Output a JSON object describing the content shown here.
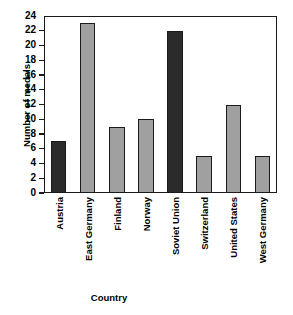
{
  "chart_data": {
    "type": "bar",
    "title": "",
    "xlabel": "Country",
    "ylabel": "Number of medals",
    "categories": [
      "Austria",
      "East Germany",
      "Finland",
      "Norway",
      "Soviet Union",
      "Switzerland",
      "United States",
      "West Germany"
    ],
    "values": [
      7,
      23,
      9,
      10,
      22,
      5,
      12,
      5
    ],
    "bar_colors": [
      "#2b2b2b",
      "#a0a0a0",
      "#a0a0a0",
      "#a0a0a0",
      "#2b2b2b",
      "#a0a0a0",
      "#a0a0a0",
      "#a0a0a0"
    ],
    "ylim": [
      0,
      24
    ],
    "ytick_step": 2,
    "ytick_labels": [
      "24",
      "22",
      "20",
      "18",
      "16",
      "14",
      "12",
      "10",
      "8",
      "6",
      "4",
      "2",
      "0"
    ],
    "ytick_values": [
      24,
      22,
      20,
      18,
      16,
      14,
      12,
      10,
      8,
      6,
      4,
      2,
      0
    ],
    "grid": false,
    "legend": "none",
    "bar_edge_color": "#1a1a1a",
    "frame_color": "#1a1a1a",
    "background": "#ffffff"
  }
}
